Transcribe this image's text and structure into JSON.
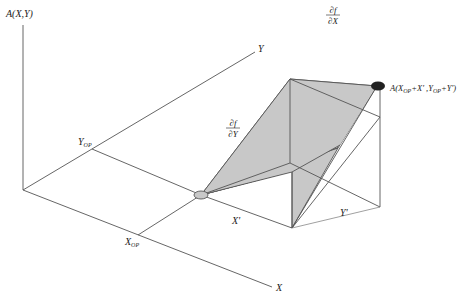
{
  "diagram": {
    "type": "3d-surface-linearization",
    "labels": {
      "vertical_axis": "A(X,Y)",
      "y_axis": "Y",
      "x_axis": "X",
      "y_op": "Y",
      "y_op_sub": "OP",
      "x_op": "X",
      "x_op_sub": "OP",
      "x_prime": "X'",
      "y_prime": "Y'",
      "partial_x_num": "∂f",
      "partial_x_den": "∂X",
      "partial_y_num": "∂f",
      "partial_y_den": "∂Y",
      "point_label_prefix": "A(X",
      "point_label_sub1": "OP",
      "point_label_mid": "+X' ,Y",
      "point_label_sub2": "OP",
      "point_label_suffix": "+Y')"
    },
    "colors": {
      "line": "#555555",
      "shaded_plane": "#c8c8c8",
      "operating_point": "#c8c8c8",
      "result_point": "#222222",
      "background": "#ffffff"
    }
  }
}
